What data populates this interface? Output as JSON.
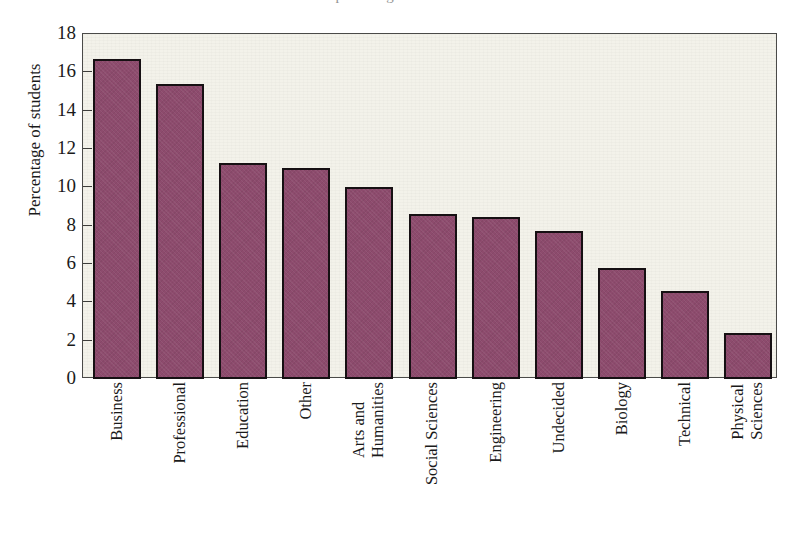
{
  "figure": {
    "title_remnant": "percentage of students",
    "background_color": "#f3f2ea",
    "page_color": "#ffffff",
    "bar_color": "#8d4b6d",
    "bar_edge_color": "#161013",
    "frame_color": "#4a4a48"
  },
  "chart_data": {
    "type": "bar",
    "title": "",
    "xlabel": "",
    "ylabel": "Percentage of students",
    "ylim": [
      0,
      18
    ],
    "yticks": [
      0,
      2,
      4,
      6,
      8,
      10,
      12,
      14,
      16,
      18
    ],
    "ytick_labels": [
      "0",
      "2",
      "4",
      "6",
      "8",
      "10",
      "12",
      "14",
      "16",
      "18"
    ],
    "grid": false,
    "legend": null,
    "xtick_rotation": 90,
    "categories": [
      "Business",
      "Professional",
      "Education",
      "Other",
      "Arts and Humanities",
      "Social Sciences",
      "Engineering",
      "Undecided",
      "Biology",
      "Technical",
      "Physical Sciences"
    ],
    "category_lines": [
      [
        "Business"
      ],
      [
        "Professional"
      ],
      [
        "Education"
      ],
      [
        "Other"
      ],
      [
        "Arts and",
        "Humanities"
      ],
      [
        "Social Sciences"
      ],
      [
        "Engineering"
      ],
      [
        "Undecided"
      ],
      [
        "Biology"
      ],
      [
        "Technical"
      ],
      [
        "Physical",
        "Sciences"
      ]
    ],
    "values": [
      16.7,
      15.4,
      11.25,
      11.0,
      10.0,
      8.6,
      8.45,
      7.7,
      5.8,
      4.6,
      2.4
    ]
  }
}
